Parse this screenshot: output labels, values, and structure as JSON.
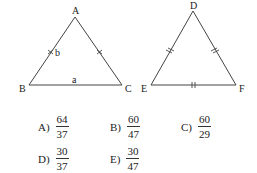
{
  "figure": {
    "triangle_abc": {
      "vertices": {
        "A": "A",
        "B": "B",
        "C": "C"
      },
      "side_labels": {
        "AB": "b",
        "BC": "a"
      },
      "tick_marks": {
        "AB": "single-cross",
        "AC": "single-cross"
      }
    },
    "triangle_def": {
      "vertices": {
        "D": "D",
        "E": "E",
        "F": "F"
      },
      "tick_marks": {
        "DE": "double",
        "DF": "double",
        "EF": "double"
      }
    }
  },
  "choices": [
    {
      "letter": "A)",
      "num": "64",
      "den": "37"
    },
    {
      "letter": "B)",
      "num": "60",
      "den": "47"
    },
    {
      "letter": "C)",
      "num": "60",
      "den": "29"
    },
    {
      "letter": "D)",
      "num": "30",
      "den": "37"
    },
    {
      "letter": "E)",
      "num": "30",
      "den": "47"
    }
  ]
}
